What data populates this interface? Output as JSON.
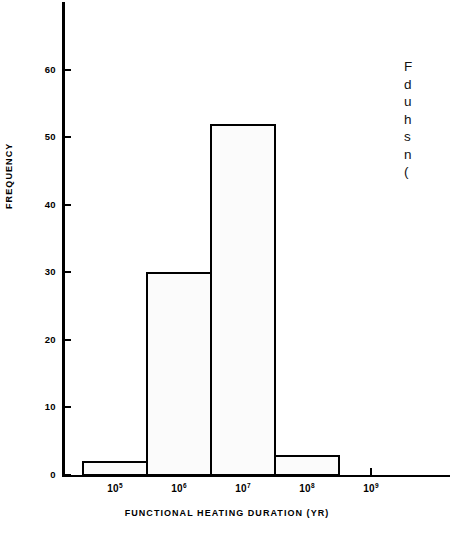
{
  "figure": {
    "background_color": "#ffffff",
    "ink_color": "#000000",
    "bar_fill_color": "#fbfbfb",
    "bar_stipple_color": "#c9c9c9"
  },
  "axis": {
    "y_title": "FREQUENCY",
    "x_title": "FUNCTIONAL HEATING DURATION (YR)"
  },
  "caption": {
    "lines": [
      "F",
      "d",
      "u",
      "h",
      "s",
      "n",
      "("
    ]
  },
  "chart_data": {
    "type": "bar",
    "title": "",
    "subtitle": "",
    "xlabel": "FUNCTIONAL HEATING DURATION (YR)",
    "ylabel": "FREQUENCY",
    "grid": false,
    "legend": "none",
    "histogram": true,
    "x_scale": "log10",
    "bin_edges_exponent": [
      4.5,
      5.5,
      6.5,
      7.5,
      8.5
    ],
    "categories": [
      "10^4.5-10^5.5",
      "10^5.5-10^6.5",
      "10^6.5-10^7.5",
      "10^7.5-10^8.5"
    ],
    "values": [
      2,
      30,
      52,
      3
    ],
    "ylim": [
      0,
      70
    ],
    "yticks": [
      0,
      10,
      20,
      30,
      40,
      50,
      60
    ],
    "ytick_labels": [
      "0",
      "10",
      "20",
      "30",
      "40",
      "50",
      "60"
    ],
    "xticks_exponent": [
      5,
      6,
      7,
      8,
      9
    ],
    "xtick_labels": [
      "10⁵",
      "10⁶",
      "10⁷",
      "10⁸",
      "10⁹"
    ],
    "xtick_mantissa": [
      "10",
      "10",
      "10",
      "10",
      "10"
    ],
    "xtick_exponents": [
      "5",
      "6",
      "7",
      "8",
      "9"
    ]
  }
}
